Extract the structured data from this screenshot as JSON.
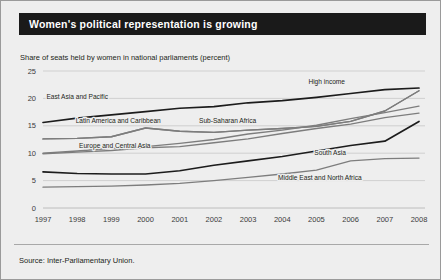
{
  "figure": {
    "title": "Women's political representation is growing",
    "subtitle": "Share of seats held by women in national parliaments (percent)",
    "source": "Source: Inter-Parliamentary Union.",
    "title_bar_color": "#1a1a1a",
    "title_text_color": "#ffffff",
    "background_color": "#eeeeee",
    "grid_color": "#c3c3c3"
  },
  "chart_data": {
    "type": "line",
    "title": "Women's political representation is growing",
    "subtitle": "Share of seats held by women in national parliaments (percent)",
    "xlabel": "",
    "ylabel": "Share of seats held by women in national parliaments (percent)",
    "x": [
      1997,
      1998,
      1999,
      2000,
      2001,
      2002,
      2003,
      2004,
      2005,
      2006,
      2007,
      2008
    ],
    "xticklabels": [
      "1997",
      "1998",
      "1999",
      "2000",
      "2001",
      "2002",
      "2003",
      "2004",
      "2005",
      "2006",
      "2007",
      "2008"
    ],
    "yticks": [
      0,
      5,
      10,
      15,
      20,
      25
    ],
    "yticklabels": [
      "0",
      "5",
      "10",
      "15",
      "20",
      "25"
    ],
    "ylim": [
      0,
      25
    ],
    "xlim": [
      1997,
      2008
    ],
    "grid": "horizontal",
    "legend": "inline-labels",
    "series": [
      {
        "name": "High income",
        "color": "#1c1c1c",
        "emphasis": "dark",
        "label_x": 2005.3,
        "label_y": 22.6,
        "values": [
          15.6,
          16.4,
          17.0,
          17.6,
          18.2,
          18.5,
          19.2,
          19.6,
          20.2,
          20.9,
          21.6,
          21.9
        ]
      },
      {
        "name": "East Asia and Pacific",
        "color": "#7d7d7d",
        "emphasis": "grey",
        "label_x": 1998.0,
        "label_y": 19.9,
        "values": [
          12.6,
          12.7,
          13.0,
          14.6,
          14.0,
          13.8,
          14.2,
          14.5,
          14.9,
          15.8,
          17.7,
          21.4
        ]
      },
      {
        "name": "Latin America and Caribbean",
        "color": "#7d7d7d",
        "emphasis": "grey",
        "label_x": 1999.2,
        "label_y": 15.6,
        "values": [
          12.6,
          12.7,
          13.0,
          14.6,
          14.0,
          13.8,
          14.2,
          14.5,
          14.9,
          15.8,
          17.7,
          21.4
        ]
      },
      {
        "name": "Sub-Saharan Africa",
        "color": "#7d7d7d",
        "emphasis": "grey",
        "label_x": 2002.4,
        "label_y": 15.5,
        "values": [
          10.0,
          10.4,
          10.9,
          11.2,
          11.8,
          12.5,
          13.5,
          14.2,
          15.1,
          16.3,
          17.4,
          18.6
        ]
      },
      {
        "name": "Europe and Central Asia",
        "color": "#7d7d7d",
        "emphasis": "grey",
        "label_x": 1999.1,
        "label_y": 10.9,
        "values": [
          9.9,
          10.2,
          10.5,
          11.0,
          11.2,
          11.9,
          12.6,
          13.6,
          14.5,
          15.3,
          16.5,
          17.3
        ]
      },
      {
        "name": "South Asia",
        "color": "#1c1c1c",
        "emphasis": "dark",
        "label_x": 2005.4,
        "label_y": 9.6,
        "values": [
          6.6,
          6.3,
          6.2,
          6.2,
          6.8,
          7.8,
          8.6,
          9.4,
          10.4,
          11.4,
          12.2,
          15.8
        ]
      },
      {
        "name": "Middle East and North Africa",
        "color": "#7d7d7d",
        "emphasis": "grey",
        "label_x": 2005.1,
        "label_y": 5.1,
        "values": [
          3.8,
          3.9,
          4.0,
          4.2,
          4.5,
          5.0,
          5.6,
          6.2,
          6.9,
          8.6,
          9.0,
          9.1
        ]
      }
    ]
  },
  "axes": {
    "y_ticks": [
      "25",
      "20",
      "15",
      "10",
      "5",
      "0"
    ],
    "x_ticks": [
      "1997",
      "1998",
      "1999",
      "2000",
      "2001",
      "2002",
      "2003",
      "2004",
      "2005",
      "2006",
      "2007",
      "2008"
    ]
  }
}
